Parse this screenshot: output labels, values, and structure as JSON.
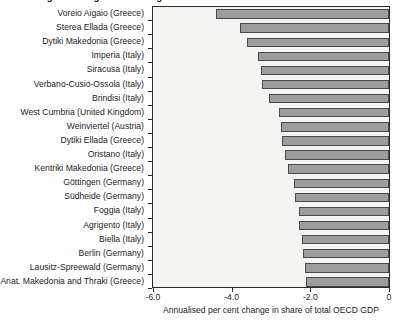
{
  "chart_data": {
    "type": "bar",
    "orientation": "horizontal",
    "title": "Figure 5. Regions with largest declines in share of OECD GDP",
    "xlabel": "Annualised per cent change in share of total OECD GDP",
    "ylabel": "",
    "xlim": [
      -6.0,
      0.0
    ],
    "xticks": [
      -6.0,
      -4.0,
      -2.0,
      0.0
    ],
    "xticklabels": [
      "-6.0",
      "-4.0",
      "-2.0",
      "0"
    ],
    "grid": false,
    "legend": null,
    "bar_fill_color": "#9d9d9d",
    "bar_edge_color": "#4a4a4a",
    "plot_background": "#f4f4f2",
    "categories": [
      "Voreio Aigaio (Greece)",
      "Sterea Ellada (Greece)",
      "Dytiki Makedonia (Greece)",
      "Imperia (Italy)",
      "Siracusa (Italy)",
      "Verbano-Cusio-Ossola (Italy)",
      "Brindisi (Italy)",
      "West Cumbria (United Kingdom)",
      "Weinviertel (Austria)",
      "Dytiki Ellada (Greece)",
      "Oristano (Italy)",
      "Kentriki Makedonia (Greece)",
      "Göttingen (Germany)",
      "Südheide (Germany)",
      "Foggia (Italy)",
      "Agrigento (Italy)",
      "Biella (Italy)",
      "Berlin (Germany)",
      "Lausitz-Spreewald (Germany)",
      "Anat.  Makedonia and Thraki (Greece)"
    ],
    "values": [
      -4.4,
      -3.78,
      -3.6,
      -3.33,
      -3.25,
      -3.22,
      -3.05,
      -2.8,
      -2.75,
      -2.72,
      -2.65,
      -2.58,
      -2.42,
      -2.38,
      -2.3,
      -2.28,
      -2.22,
      -2.18,
      -2.14,
      -2.1
    ]
  }
}
